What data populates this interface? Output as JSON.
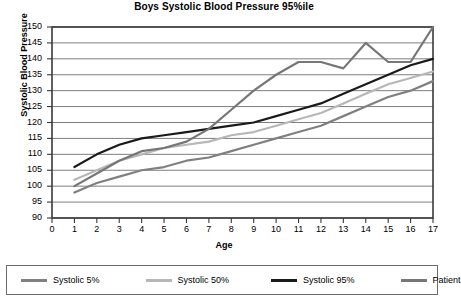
{
  "chart_data": {
    "type": "line",
    "title": "Boys Systolic Blood Pressure 95%ile",
    "xlabel": "Age",
    "ylabel": "Systolic Blood Pressure",
    "xlim": [
      0,
      17
    ],
    "ylim": [
      90,
      150
    ],
    "xticks": [
      0,
      1,
      2,
      3,
      4,
      5,
      6,
      7,
      8,
      9,
      10,
      11,
      12,
      13,
      14,
      15,
      16,
      17
    ],
    "yticks": [
      90,
      95,
      100,
      105,
      110,
      115,
      120,
      125,
      130,
      135,
      140,
      145,
      150
    ],
    "grid": "horizontal",
    "legend_position": "bottom",
    "x": [
      1,
      2,
      3,
      4,
      5,
      6,
      7,
      8,
      9,
      10,
      11,
      12,
      13,
      14,
      15,
      16,
      17
    ],
    "series": [
      {
        "name": "Systolic 5%",
        "color": "#808080",
        "width": 2.2,
        "values": [
          98,
          101,
          103,
          105,
          106,
          108,
          109,
          111,
          113,
          115,
          117,
          119,
          122,
          125,
          128,
          130,
          133
        ]
      },
      {
        "name": "Systolic 50%",
        "color": "#b7b7b7",
        "width": 2.2,
        "values": [
          102,
          105,
          108,
          110,
          112,
          113,
          114,
          116,
          117,
          119,
          121,
          123,
          126,
          129,
          132,
          134,
          136
        ]
      },
      {
        "name": "Systolic 95%",
        "color": "#1a1a1a",
        "width": 2.2,
        "values": [
          106,
          110,
          113,
          115,
          116,
          117,
          118,
          119,
          120,
          122,
          124,
          126,
          129,
          132,
          135,
          138,
          140
        ]
      },
      {
        "name": "Patient",
        "color": "#767676",
        "width": 2.2,
        "values": [
          100,
          104,
          108,
          111,
          112,
          114,
          118,
          124,
          130,
          135,
          139,
          139,
          137,
          145,
          139,
          139,
          150
        ]
      }
    ]
  },
  "legend": {
    "items": [
      {
        "label": "Systolic 5%",
        "color": "#808080"
      },
      {
        "label": "Systolic 50%",
        "color": "#b7b7b7"
      },
      {
        "label": "Systolic 95%",
        "color": "#1a1a1a"
      },
      {
        "label": "Patient",
        "color": "#767676"
      }
    ]
  },
  "axis_colors": {
    "frame": "#3a3a3a",
    "gridline": "#6f6f6f",
    "text": "#000000"
  }
}
